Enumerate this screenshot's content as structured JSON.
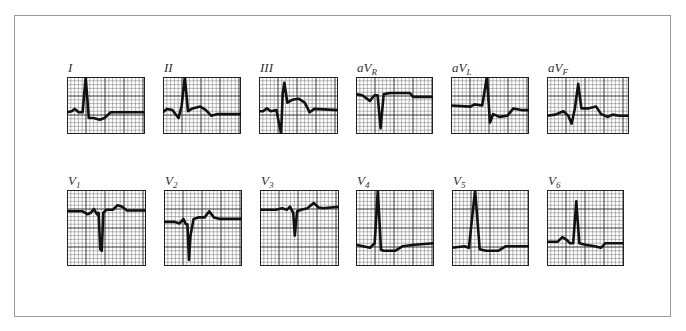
{
  "figure": {
    "rows": [
      {
        "leads": [
          {
            "id": "I",
            "label": "I",
            "sub": "",
            "trace": [
              [
                0,
                0.62
              ],
              [
                0.06,
                0.6
              ],
              [
                0.1,
                0.56
              ],
              [
                0.15,
                0.62
              ],
              [
                0.18,
                0.62
              ],
              [
                0.2,
                0.62
              ],
              [
                0.24,
                0.0
              ],
              [
                0.28,
                0.72
              ],
              [
                0.34,
                0.72
              ],
              [
                0.42,
                0.75
              ],
              [
                0.48,
                0.72
              ],
              [
                0.56,
                0.62
              ],
              [
                0.7,
                0.62
              ],
              [
                1,
                0.62
              ]
            ]
          },
          {
            "id": "II",
            "label": "II",
            "sub": "",
            "trace": [
              [
                0,
                0.62
              ],
              [
                0.05,
                0.56
              ],
              [
                0.12,
                0.58
              ],
              [
                0.2,
                0.72
              ],
              [
                0.24,
                0.5
              ],
              [
                0.28,
                0.0
              ],
              [
                0.32,
                0.6
              ],
              [
                0.38,
                0.55
              ],
              [
                0.48,
                0.52
              ],
              [
                0.55,
                0.58
              ],
              [
                0.62,
                0.68
              ],
              [
                0.7,
                0.65
              ],
              [
                1,
                0.65
              ]
            ]
          },
          {
            "id": "III",
            "label": "III",
            "sub": "",
            "trace": [
              [
                0,
                0.6
              ],
              [
                0.05,
                0.6
              ],
              [
                0.1,
                0.55
              ],
              [
                0.15,
                0.6
              ],
              [
                0.22,
                0.58
              ],
              [
                0.28,
                1.0
              ],
              [
                0.3,
                0.3
              ],
              [
                0.32,
                0.1
              ],
              [
                0.36,
                0.45
              ],
              [
                0.42,
                0.4
              ],
              [
                0.5,
                0.38
              ],
              [
                0.58,
                0.45
              ],
              [
                0.64,
                0.62
              ],
              [
                0.7,
                0.56
              ],
              [
                1,
                0.58
              ]
            ]
          },
          {
            "id": "aVR",
            "label": "aV",
            "sub": "R",
            "trace": [
              [
                0,
                0.3
              ],
              [
                0.08,
                0.32
              ],
              [
                0.18,
                0.42
              ],
              [
                0.24,
                0.32
              ],
              [
                0.28,
                0.32
              ],
              [
                0.32,
                0.9
              ],
              [
                0.36,
                0.3
              ],
              [
                0.44,
                0.28
              ],
              [
                0.7,
                0.28
              ],
              [
                0.74,
                0.35
              ],
              [
                1,
                0.35
              ]
            ]
          },
          {
            "id": "aVL",
            "label": "aV",
            "sub": "L",
            "trace": [
              [
                0,
                0.5
              ],
              [
                0.25,
                0.52
              ],
              [
                0.3,
                0.48
              ],
              [
                0.4,
                0.5
              ],
              [
                0.46,
                0.0
              ],
              [
                0.5,
                0.8
              ],
              [
                0.54,
                0.65
              ],
              [
                0.62,
                0.7
              ],
              [
                0.72,
                0.68
              ],
              [
                0.8,
                0.55
              ],
              [
                0.9,
                0.58
              ],
              [
                1,
                0.58
              ]
            ]
          },
          {
            "id": "aVF",
            "label": "aV",
            "sub": "F",
            "trace": [
              [
                0,
                0.68
              ],
              [
                0.1,
                0.66
              ],
              [
                0.2,
                0.6
              ],
              [
                0.26,
                0.68
              ],
              [
                0.3,
                0.82
              ],
              [
                0.34,
                0.55
              ],
              [
                0.38,
                0.12
              ],
              [
                0.42,
                0.55
              ],
              [
                0.5,
                0.55
              ],
              [
                0.6,
                0.52
              ],
              [
                0.66,
                0.65
              ],
              [
                0.74,
                0.7
              ],
              [
                0.8,
                0.66
              ],
              [
                0.88,
                0.68
              ],
              [
                1,
                0.68
              ]
            ]
          }
        ]
      },
      {
        "leads": [
          {
            "id": "V1",
            "label": "V",
            "sub": "1",
            "trace": [
              [
                0,
                0.28
              ],
              [
                0.2,
                0.28
              ],
              [
                0.26,
                0.32
              ],
              [
                0.3,
                0.3
              ],
              [
                0.34,
                0.25
              ],
              [
                0.38,
                0.32
              ],
              [
                0.4,
                0.3
              ],
              [
                0.42,
                0.78
              ],
              [
                0.44,
                0.8
              ],
              [
                0.46,
                0.3
              ],
              [
                0.5,
                0.26
              ],
              [
                0.58,
                0.26
              ],
              [
                0.64,
                0.2
              ],
              [
                0.7,
                0.22
              ],
              [
                0.76,
                0.27
              ],
              [
                1,
                0.27
              ]
            ]
          },
          {
            "id": "V2",
            "label": "V",
            "sub": "2",
            "trace": [
              [
                0,
                0.42
              ],
              [
                0.14,
                0.42
              ],
              [
                0.2,
                0.44
              ],
              [
                0.25,
                0.38
              ],
              [
                0.28,
                0.45
              ],
              [
                0.3,
                0.45
              ],
              [
                0.32,
                0.92
              ],
              [
                0.34,
                0.6
              ],
              [
                0.38,
                0.38
              ],
              [
                0.44,
                0.36
              ],
              [
                0.52,
                0.36
              ],
              [
                0.58,
                0.28
              ],
              [
                0.64,
                0.36
              ],
              [
                0.72,
                0.38
              ],
              [
                1,
                0.38
              ]
            ]
          },
          {
            "id": "V3",
            "label": "V",
            "sub": "3",
            "trace": [
              [
                0,
                0.26
              ],
              [
                0.2,
                0.26
              ],
              [
                0.28,
                0.24
              ],
              [
                0.34,
                0.26
              ],
              [
                0.38,
                0.22
              ],
              [
                0.4,
                0.26
              ],
              [
                0.42,
                0.3
              ],
              [
                0.44,
                0.6
              ],
              [
                0.47,
                0.28
              ],
              [
                0.52,
                0.26
              ],
              [
                0.6,
                0.24
              ],
              [
                0.68,
                0.17
              ],
              [
                0.74,
                0.23
              ],
              [
                0.8,
                0.24
              ],
              [
                1,
                0.22
              ]
            ]
          },
          {
            "id": "V4",
            "label": "V",
            "sub": "4",
            "trace": [
              [
                0,
                0.72
              ],
              [
                0.18,
                0.76
              ],
              [
                0.24,
                0.7
              ],
              [
                0.28,
                0.0
              ],
              [
                0.32,
                0.79
              ],
              [
                0.36,
                0.8
              ],
              [
                0.5,
                0.8
              ],
              [
                0.6,
                0.74
              ],
              [
                0.75,
                0.72
              ],
              [
                1,
                0.7
              ]
            ]
          },
          {
            "id": "V5",
            "label": "V",
            "sub": "5",
            "trace": [
              [
                0,
                0.76
              ],
              [
                0.16,
                0.74
              ],
              [
                0.22,
                0.76
              ],
              [
                0.3,
                0.0
              ],
              [
                0.36,
                0.78
              ],
              [
                0.44,
                0.8
              ],
              [
                0.6,
                0.8
              ],
              [
                0.7,
                0.74
              ],
              [
                1,
                0.74
              ]
            ]
          },
          {
            "id": "V6",
            "label": "V",
            "sub": "6",
            "trace": [
              [
                0,
                0.68
              ],
              [
                0.14,
                0.68
              ],
              [
                0.2,
                0.62
              ],
              [
                0.26,
                0.66
              ],
              [
                0.3,
                0.7
              ],
              [
                0.34,
                0.7
              ],
              [
                0.38,
                0.15
              ],
              [
                0.42,
                0.7
              ],
              [
                0.5,
                0.72
              ],
              [
                0.62,
                0.74
              ],
              [
                0.7,
                0.76
              ],
              [
                0.76,
                0.7
              ],
              [
                1,
                0.7
              ]
            ]
          }
        ]
      }
    ]
  },
  "colors": {
    "trace": "#111111",
    "grid_minor": "#666666",
    "grid_major": "#222222",
    "frame": "#9a9a9a",
    "label": "#333333"
  }
}
